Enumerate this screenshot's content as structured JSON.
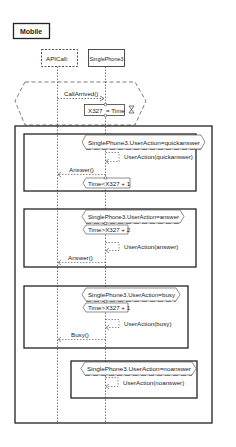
{
  "diagram": {
    "title": "Mobile",
    "lifelines": [
      {
        "name": "APICall:",
        "style": "dashed"
      },
      {
        "name": "SinglePhone3",
        "style": "solid"
      }
    ],
    "trigger": {
      "message": "CallArrived()",
      "assignment": "X327 := Time"
    },
    "alternatives": [
      {
        "condition": "SinglePhone3.UserAction=quickanswer",
        "self_message": "UserAction(quickanswer)",
        "reply": "Answer()",
        "time_condition": "Time<X327 + 1"
      },
      {
        "condition": "SinglePhone3.UserAction=answer",
        "time_condition": "Time>X327 + 2",
        "self_message": "UserAction(answer)",
        "reply": "Answer()"
      },
      {
        "condition": "SinglePhone3.UserAction=busy",
        "time_condition": "Time>X327 + 1",
        "self_message": "UserAction(busy)",
        "reply": "Busy()"
      },
      {
        "condition": "SinglePhone3.UserAction=noanswer",
        "self_message": "UserAction(noanswer)"
      }
    ]
  },
  "labels": {
    "t_title": "Mobile",
    "t_api": "APICall:",
    "t_phone": "SinglePhone3",
    "t_callarrived": "CallArrived()",
    "t_assign_a": "X327",
    "t_assign_b": "= Time",
    "t_c1": "SinglePhone3.UserAction=quickanswer",
    "t_m1": "UserAction(quickanswer)",
    "t_r1": "Answer()",
    "t_tc1": "Time<X327 + 1",
    "t_c2": "SinglePhone3.UserAction=answer",
    "t_tc2": "Time>X327 + 2",
    "t_m2": "UserAction(answer)",
    "t_r2": "Answer()",
    "t_c3": "SinglePhone3.UserAction=busy",
    "t_tc3": "Time>X327 + 1",
    "t_m3": "UserAction(busy)",
    "t_r3": "Busy()",
    "t_c4": "SinglePhone3.UserAction=noanswer",
    "t_m4": "UserAction(noanswer)"
  },
  "colors": {
    "line": "#222222",
    "background": "#ffffff"
  }
}
